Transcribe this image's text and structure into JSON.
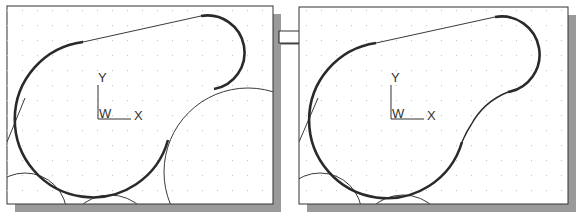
{
  "figure": {
    "colors": {
      "background": "#ffffff",
      "frame": "#333333",
      "shadow": "#9a9a9a",
      "grid_dot": "#c8c8c8",
      "thick_outline": "#2a2a2a",
      "thin_line": "#3a3a3a"
    },
    "left_panel": {
      "label": "before-trim",
      "ucs": {
        "y_label": "Y",
        "x_label": "X",
        "origin_label": "W"
      }
    },
    "right_panel": {
      "label": "after-trim",
      "ucs": {
        "y_label": "Y",
        "x_label": "X",
        "origin_label": "W"
      }
    },
    "arrow": {
      "direction": "right",
      "icon": "right-arrow-icon"
    },
    "grid": {
      "spacing_px": 15
    }
  }
}
